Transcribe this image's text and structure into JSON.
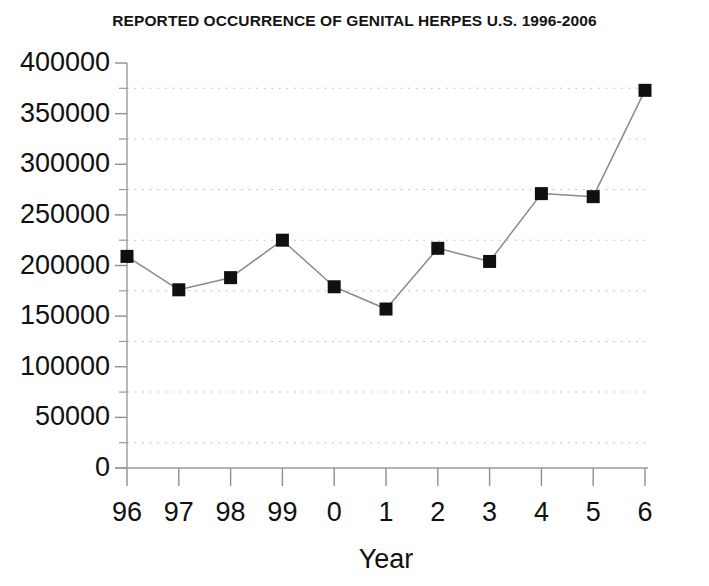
{
  "chart_data": {
    "type": "line",
    "title": "REPORTED OCCURRENCE OF GENITAL HERPES U.S. 1996-2006",
    "xlabel": "Year",
    "ylabel": "",
    "categories": [
      "96",
      "97",
      "98",
      "99",
      "0",
      "1",
      "2",
      "3",
      "4",
      "5",
      "6"
    ],
    "values": [
      209000,
      176000,
      188000,
      225000,
      179000,
      157000,
      217000,
      204000,
      271000,
      268000,
      373000
    ],
    "series": [
      {
        "name": "Reported cases",
        "values": [
          209000,
          176000,
          188000,
          225000,
          179000,
          157000,
          217000,
          204000,
          271000,
          268000,
          373000
        ]
      }
    ],
    "ylim": [
      0,
      400000
    ],
    "ytick_labels": [
      "0",
      "50000",
      "100000",
      "150000",
      "200000",
      "250000",
      "300000",
      "350000",
      "400000"
    ],
    "ytick_values": [
      0,
      50000,
      100000,
      150000,
      200000,
      250000,
      300000,
      350000,
      400000
    ],
    "yminor_tick_step": 25000,
    "gridlines": {
      "horizontal": "dotted",
      "vertical": "none",
      "values": [
        25000,
        75000,
        125000,
        175000,
        225000,
        275000,
        325000,
        375000
      ]
    },
    "legend": "none",
    "marker": "filled-square",
    "marker_color": "#101010",
    "line_color": "#8a8a8a",
    "background_color": "#ffffff",
    "axis_color": "#9a9a9a"
  }
}
